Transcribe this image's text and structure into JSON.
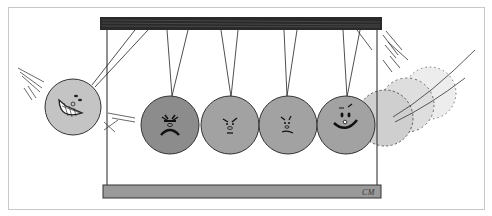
{
  "illustration": {
    "subject": "Newton's cradle cartoon with faces on the balls",
    "signature": "CM",
    "colors": {
      "frame_border": "#c8c8c8",
      "top_bar": "#2a2a2a",
      "base_bar": "#9a9a9a",
      "ball_light": "#c4c4c4",
      "ball_dark": "#8c8c8c",
      "ball_mid": "#a2a2a2",
      "ghost_ball": "#d6d6d6",
      "line": "#222222"
    },
    "balls": [
      {
        "position": "swinging-left",
        "expression": "grinning"
      },
      {
        "position": "hanging-1",
        "expression": "angry"
      },
      {
        "position": "hanging-2",
        "expression": "annoyed"
      },
      {
        "position": "hanging-3",
        "expression": "worried"
      },
      {
        "position": "hanging-4",
        "expression": "smiling"
      },
      {
        "position": "swinging-right-ghost",
        "expression": "none"
      }
    ]
  }
}
